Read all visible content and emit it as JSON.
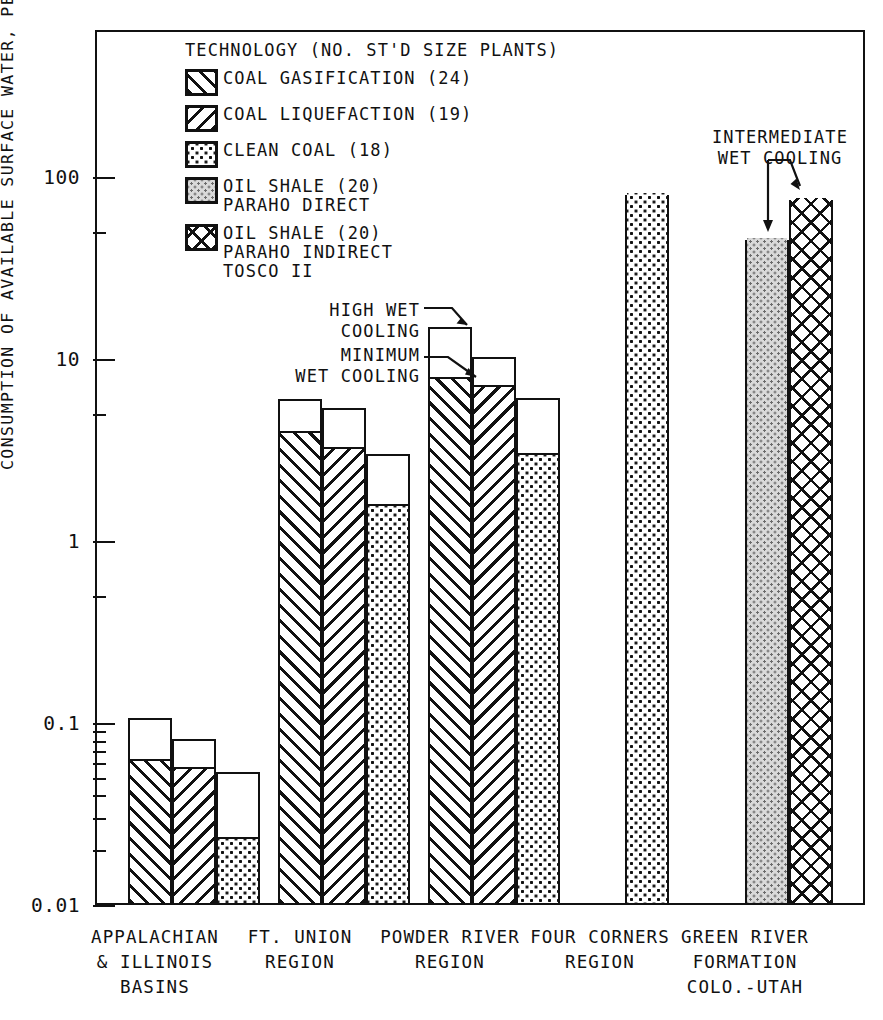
{
  "axis": {
    "y_title": "CONSUMPTION OF AVAILABLE SURFACE WATER, PERCENT",
    "y_ticks": [
      "100",
      "10",
      "1",
      "0.1",
      "0.01"
    ]
  },
  "legend": {
    "title": "TECHNOLOGY (NO. ST'D SIZE PLANTS)",
    "items": [
      {
        "label": "COAL GASIFICATION (24)",
        "pattern": "p-gasification",
        "key": "gasification"
      },
      {
        "label": "COAL LIQUEFACTION (19)",
        "pattern": "p-liquefaction",
        "key": "liquefaction"
      },
      {
        "label": "CLEAN COAL (18)",
        "pattern": "p-cleancoal",
        "key": "cleancoal"
      },
      {
        "label": "OIL SHALE (20)\nPARAHO DIRECT",
        "pattern": "p-paraho-direct",
        "key": "paraho_direct"
      },
      {
        "label": "OIL SHALE (20)\nPARAHO INDIRECT\nTOSCO II",
        "pattern": "p-paraho-indirect",
        "key": "paraho_indirect"
      }
    ]
  },
  "annotations": {
    "high_wet": "HIGH WET\nCOOLING",
    "minimum_wet": "MINIMUM\nWET COOLING",
    "intermediate_wet": "INTERMEDIATE\nWET COOLING"
  },
  "categories": [
    "APPALACHIAN\n& ILLINOIS\nBASINS",
    "FT. UNION\nREGION",
    "POWDER RIVER\nREGION",
    "FOUR CORNERS\nREGION",
    "GREEN RIVER\nFORMATION\nCOLO.-UTAH"
  ],
  "chart_data": {
    "type": "bar",
    "title": "",
    "xlabel": "",
    "ylabel": "CONSUMPTION OF AVAILABLE SURFACE WATER, PERCENT",
    "yscale": "log",
    "ylim": [
      0.01,
      200
    ],
    "ytick_values": [
      100,
      10,
      1,
      0.1,
      0.01
    ],
    "grid": false,
    "legend_position": "inside-top-left",
    "stacked": true,
    "stack_levels": [
      "minimum wet cooling",
      "high wet cooling"
    ],
    "categories": [
      "APPALACHIAN & ILLINOIS BASINS",
      "FT. UNION REGION",
      "POWDER RIVER REGION",
      "FOUR CORNERS REGION",
      "GREEN RIVER FORMATION COLO.-UTAH"
    ],
    "series": [
      {
        "name": "COAL GASIFICATION (24)",
        "pattern": "p-gasification",
        "minimum_wet_cooling": [
          0.062,
          3.9,
          7.8,
          null,
          null
        ],
        "high_wet_cooling": [
          0.107,
          6.0,
          15.0,
          null,
          null
        ]
      },
      {
        "name": "COAL LIQUEFACTION (19)",
        "pattern": "p-liquefaction",
        "minimum_wet_cooling": [
          0.056,
          3.2,
          7.0,
          null,
          null
        ],
        "high_wet_cooling": [
          0.082,
          5.4,
          10.3,
          null,
          null
        ]
      },
      {
        "name": "CLEAN COAL (18)",
        "pattern": "p-cleancoal",
        "minimum_wet_cooling": [
          0.023,
          1.55,
          2.95,
          80.0,
          null
        ],
        "high_wet_cooling": [
          0.054,
          3.0,
          6.1,
          80.0,
          null
        ]
      },
      {
        "name": "OIL SHALE (20) PARAHO DIRECT",
        "pattern": "p-paraho-direct",
        "minimum_wet_cooling": [
          null,
          null,
          null,
          null,
          45.0
        ],
        "high_wet_cooling": [
          null,
          null,
          null,
          null,
          45.0
        ]
      },
      {
        "name": "OIL SHALE (20) PARAHO INDIRECT TOSCO II",
        "pattern": "p-paraho-indirect",
        "minimum_wet_cooling": [
          null,
          null,
          null,
          null,
          75.0
        ],
        "high_wet_cooling": [
          null,
          null,
          null,
          null,
          75.0
        ]
      }
    ],
    "annotations": [
      {
        "text": "HIGH WET COOLING",
        "points_to": "top of open segment, POWDER RIVER gasification bar"
      },
      {
        "text": "MINIMUM WET COOLING",
        "points_to": "top of hatched segment, POWDER RIVER gasification bar"
      },
      {
        "text": "INTERMEDIATE WET COOLING",
        "points_to": "tops of GREEN RIVER oil shale bars"
      }
    ]
  },
  "bars": [
    {
      "group": 0,
      "series": 0,
      "x": 128,
      "w": 44,
      "total": 0.107,
      "base": 0.062
    },
    {
      "group": 0,
      "series": 1,
      "x": 172,
      "w": 44,
      "total": 0.082,
      "base": 0.056
    },
    {
      "group": 0,
      "series": 2,
      "x": 216,
      "w": 44,
      "total": 0.054,
      "base": 0.023
    },
    {
      "group": 1,
      "series": 0,
      "x": 278,
      "w": 44,
      "total": 6.0,
      "base": 3.9
    },
    {
      "group": 1,
      "series": 1,
      "x": 322,
      "w": 44,
      "total": 5.4,
      "base": 3.2
    },
    {
      "group": 1,
      "series": 2,
      "x": 366,
      "w": 44,
      "total": 3.0,
      "base": 1.55
    },
    {
      "group": 2,
      "series": 0,
      "x": 428,
      "w": 44,
      "total": 15.0,
      "base": 7.8
    },
    {
      "group": 2,
      "series": 1,
      "x": 472,
      "w": 44,
      "total": 10.3,
      "base": 7.0
    },
    {
      "group": 2,
      "series": 2,
      "x": 516,
      "w": 44,
      "total": 6.1,
      "base": 2.95
    },
    {
      "group": 3,
      "series": 2,
      "x": 625,
      "w": 44,
      "total": 80.0,
      "base": 80.0
    },
    {
      "group": 4,
      "series": 3,
      "x": 745,
      "w": 44,
      "total": 45.0,
      "base": 45.0
    },
    {
      "group": 4,
      "series": 4,
      "x": 789,
      "w": 44,
      "total": 75.0,
      "base": 75.0
    }
  ],
  "xlabel_positions": [
    155,
    300,
    450,
    600,
    745
  ]
}
